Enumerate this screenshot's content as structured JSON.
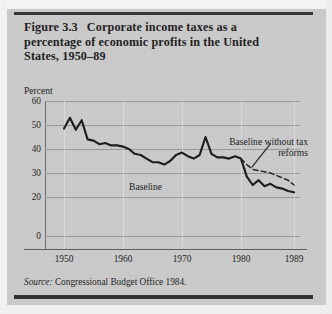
{
  "figure": {
    "number": "Figure 3.3",
    "title": "Corporate income taxes as a percentage of economic profits in the United States, 1950–89",
    "source_word": "Source:",
    "source_text": " Congressional Budget Office 1984."
  },
  "axes": {
    "y_axis_title": "Percent",
    "y_ticks": [
      "60",
      "50",
      "40",
      "30",
      "20",
      "0"
    ],
    "x_ticks": [
      "1950",
      "1960",
      "1970",
      "1980",
      "1989"
    ]
  },
  "annotations": {
    "baseline_label": "Baseline",
    "no_reform_label": "Baseline without tax reforms"
  },
  "colors": {
    "paper": "#cacaca",
    "ink": "#1c1c1c",
    "gridline": "#8e8e8e",
    "rule": "#353535"
  },
  "chart_data": {
    "type": "line",
    "xlabel": "",
    "ylabel": "Percent",
    "xlim": [
      1950,
      1989
    ],
    "ylim": [
      0,
      60
    ],
    "y_ticks": [
      0,
      20,
      30,
      40,
      50,
      60
    ],
    "y_tick_note": "Axis is broken between 0 and 20; the 10 tick is omitted.",
    "x_ticks": [
      1950,
      1960,
      1970,
      1980,
      1989
    ],
    "grid": "horizontal gridlines at each labeled y tick; faint vertical gridlines at each labeled year",
    "legend": "inline labels on the plot (no legend box)",
    "series": [
      {
        "name": "Baseline",
        "style": "solid",
        "x": [
          1950,
          1951,
          1952,
          1953,
          1954,
          1955,
          1956,
          1957,
          1958,
          1959,
          1960,
          1961,
          1962,
          1963,
          1964,
          1965,
          1966,
          1967,
          1968,
          1969,
          1970,
          1971,
          1972,
          1973,
          1974,
          1975,
          1976,
          1977,
          1978,
          1979,
          1980,
          1981,
          1982,
          1983,
          1984,
          1985,
          1986,
          1987,
          1988,
          1989
        ],
        "values": [
          48.5,
          53.0,
          48.0,
          52.0,
          44.0,
          43.5,
          42.0,
          42.5,
          41.5,
          41.5,
          41.0,
          40.0,
          38.0,
          37.5,
          36.0,
          34.5,
          34.5,
          33.5,
          35.0,
          37.5,
          38.5,
          37.0,
          36.0,
          37.5,
          45.0,
          38.0,
          36.5,
          36.5,
          36.0,
          37.0,
          36.0,
          28.5,
          25.0,
          27.0,
          24.5,
          25.5,
          24.0,
          23.5,
          22.5,
          22.0
        ]
      },
      {
        "name": "Baseline without tax reforms",
        "style": "dashed",
        "x": [
          1980,
          1981,
          1982,
          1983,
          1984,
          1985,
          1986,
          1987,
          1988,
          1989
        ],
        "values": [
          36.0,
          33.5,
          31.5,
          31.0,
          30.5,
          30.0,
          29.0,
          28.0,
          27.0,
          25.0
        ]
      }
    ]
  }
}
